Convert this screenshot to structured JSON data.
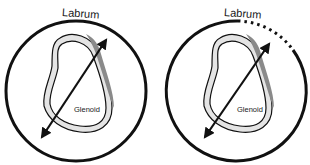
{
  "diagrams": [
    {
      "id": "intact",
      "labels": {
        "labrum": "Labrum",
        "glenoid": "Glenoid"
      },
      "labrum_style": "solid"
    },
    {
      "id": "torn",
      "labels": {
        "labrum": "Labrum",
        "glenoid": "Glenoid"
      },
      "labrum_style": "partially-dotted"
    }
  ],
  "colors": {
    "stroke": "#111111",
    "rim_shade": "#8a8a8a",
    "rim_light": "#e4e4e4",
    "background": "#ffffff"
  }
}
